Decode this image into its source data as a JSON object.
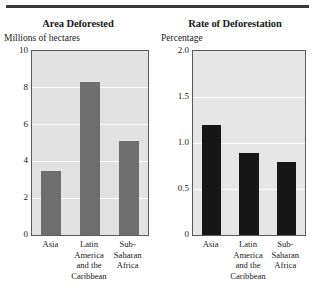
{
  "figure": {
    "has_top_rule": true,
    "rule_color": "#3a3a3a",
    "background": "#ffffff"
  },
  "chart_data": [
    {
      "type": "bar",
      "panel": "left",
      "title": "Area Deforested",
      "ylabel": "Millions of hectares",
      "xlabel": "",
      "categories": [
        "Asia",
        "Latin America and the Caribbean",
        "Sub-Saharan Africa"
      ],
      "category_lines": [
        [
          "Asia"
        ],
        [
          "Latin",
          "America",
          "and the",
          "Caribbean"
        ],
        [
          "Sub-",
          "Saharan",
          "Africa"
        ]
      ],
      "values": [
        3.5,
        8.3,
        5.1
      ],
      "ylim": [
        0,
        10
      ],
      "yticks": [
        0,
        2,
        4,
        6,
        8,
        10
      ],
      "ytick_labels": [
        "0",
        "2",
        "4",
        "6",
        "8",
        "10"
      ],
      "grid": true,
      "legend": "none",
      "bar_color": "#6e6e6e",
      "plot_background": "#e2e2e2"
    },
    {
      "type": "bar",
      "panel": "right",
      "title": "Rate of Deforestation",
      "ylabel": "Percentage",
      "xlabel": "",
      "categories": [
        "Asia",
        "Latin America and the Caribbean",
        "Sub-Saharan Africa"
      ],
      "category_lines": [
        [
          "Asia"
        ],
        [
          "Latin",
          "America",
          "and the",
          "Caribbean"
        ],
        [
          "Sub-",
          "Saharan",
          "Africa"
        ]
      ],
      "values": [
        1.2,
        0.89,
        0.79
      ],
      "ylim": [
        0,
        2.0
      ],
      "yticks": [
        0,
        0.5,
        1.0,
        1.5,
        2.0
      ],
      "ytick_labels": [
        "0",
        "0.5",
        "1.0",
        "1.5",
        "2.0"
      ],
      "grid": true,
      "legend": "none",
      "bar_color": "#161616",
      "plot_background": "#e6e6e6"
    }
  ]
}
